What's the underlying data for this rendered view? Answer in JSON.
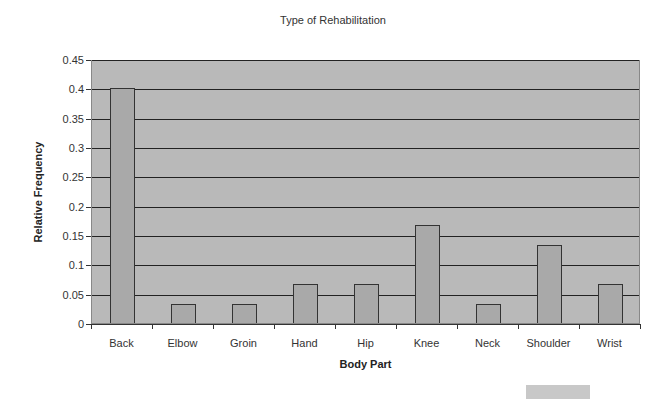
{
  "chart_data": {
    "type": "bar",
    "title": "Type of Rehabilitation",
    "xlabel": "Body Part",
    "ylabel": "Relative Frequency",
    "categories": [
      "Back",
      "Elbow",
      "Groin",
      "Hand",
      "Hip",
      "Knee",
      "Neck",
      "Shoulder",
      "Wrist"
    ],
    "values": [
      0.4,
      0.033,
      0.033,
      0.067,
      0.067,
      0.167,
      0.033,
      0.133,
      0.067
    ],
    "ylim": [
      0,
      0.45
    ],
    "yticks": [
      "0",
      "0.05",
      "0.1",
      "0.15",
      "0.2",
      "0.25",
      "0.3",
      "0.35",
      "0.4",
      "0.45"
    ],
    "grid": true,
    "legend": "none",
    "colors": {
      "plot_background": "#b9b9b9",
      "bar_fill": "#a9a9a9",
      "bar_border": "#333333"
    }
  }
}
